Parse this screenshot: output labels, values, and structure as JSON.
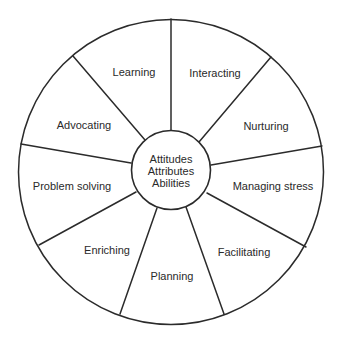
{
  "diagram": {
    "type": "wheel",
    "colors": {
      "line": "#2b2b2b",
      "text": "#2a2a2a",
      "background": "#ffffff"
    },
    "outer_circle": {
      "cx": 171,
      "cy": 172,
      "r": 152.5
    },
    "inner_circle": {
      "cx": 171,
      "cy": 170,
      "r": 39.5
    },
    "center_label": {
      "lines": [
        "Attitudes",
        "Attributes",
        "Abilities"
      ],
      "positions": [
        {
          "x": 171,
          "y": 163
        },
        {
          "x": 171,
          "y": 175
        },
        {
          "x": 171,
          "y": 187
        }
      ]
    },
    "spokes": [
      {
        "x1": 171,
        "y1": 130,
        "x2": 171,
        "y2": 19
      },
      {
        "x1": 199,
        "y1": 142,
        "x2": 271,
        "y2": 57
      },
      {
        "x1": 211,
        "y1": 165,
        "x2": 322,
        "y2": 146
      },
      {
        "x1": 207,
        "y1": 193,
        "x2": 306,
        "y2": 247
      },
      {
        "x1": 186,
        "y1": 207,
        "x2": 224,
        "y2": 314
      },
      {
        "x1": 157,
        "y1": 208,
        "x2": 120,
        "y2": 314
      },
      {
        "x1": 136,
        "y1": 192,
        "x2": 39,
        "y2": 245
      },
      {
        "x1": 131,
        "y1": 163,
        "x2": 21,
        "y2": 144
      },
      {
        "x1": 145,
        "y1": 140,
        "x2": 73,
        "y2": 56
      }
    ],
    "segments": [
      {
        "label": "Learning",
        "x": 134,
        "y": 76
      },
      {
        "label": "Interacting",
        "x": 215,
        "y": 77
      },
      {
        "label": "Nurturing",
        "x": 266,
        "y": 130
      },
      {
        "label": "Managing stress",
        "x": 273,
        "y": 190
      },
      {
        "label": "Facilitating",
        "x": 244,
        "y": 256
      },
      {
        "label": "Planning",
        "x": 172,
        "y": 280
      },
      {
        "label": "Enriching",
        "x": 107,
        "y": 254
      },
      {
        "label": "Problem solving",
        "x": 72,
        "y": 190
      },
      {
        "label": "Advocating",
        "x": 84,
        "y": 129
      }
    ]
  }
}
